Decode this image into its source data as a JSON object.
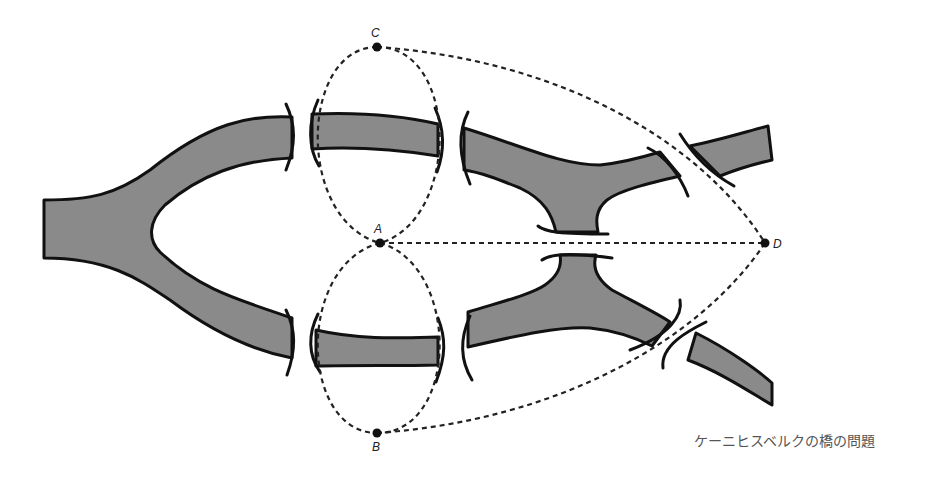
{
  "diagram": {
    "type": "graph-over-map",
    "nodes": [
      {
        "id": "A",
        "label": "A",
        "x": 380,
        "y": 243
      },
      {
        "id": "B",
        "label": "B",
        "x": 377,
        "y": 433
      },
      {
        "id": "C",
        "label": "C",
        "x": 377,
        "y": 47
      },
      {
        "id": "D",
        "label": "D",
        "x": 765,
        "y": 243
      }
    ],
    "edges": [
      [
        "A",
        "C"
      ],
      [
        "A",
        "C"
      ],
      [
        "A",
        "B"
      ],
      [
        "A",
        "B"
      ],
      [
        "A",
        "D"
      ],
      [
        "C",
        "D"
      ],
      [
        "B",
        "D"
      ]
    ],
    "colors": {
      "river": "#8a8a8a",
      "outline": "#111111",
      "edge": "#222222",
      "caption": "#555555"
    }
  },
  "caption": "ケーニヒスベルクの橋の問題"
}
